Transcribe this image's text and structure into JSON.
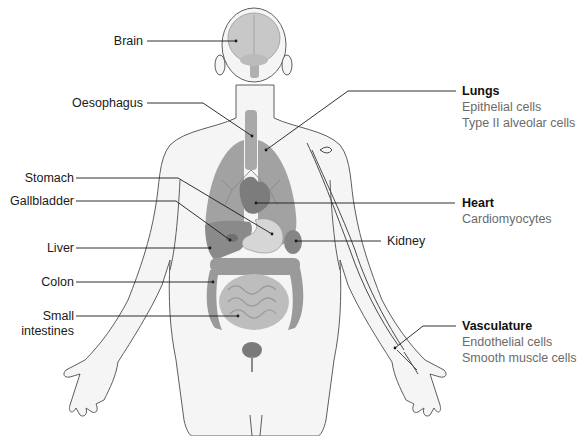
{
  "colors": {
    "background": "#ffffff",
    "body_fill": "#f4f4f4",
    "body_outline": "#5a5a5a",
    "organ_dark": "#8a8a8a",
    "organ_mid": "#a6a6a6",
    "organ_light": "#c9c9c9",
    "leader_line": "#1a1a1a",
    "label_text": "#1a1a1a",
    "subtitle_text": "#6b6b6b"
  },
  "left_labels": [
    {
      "id": "brain",
      "text": "Brain"
    },
    {
      "id": "oesophagus",
      "text": "Oesophagus"
    },
    {
      "id": "stomach",
      "text": "Stomach"
    },
    {
      "id": "gallbladder",
      "text": "Gallbladder"
    },
    {
      "id": "liver",
      "text": "Liver"
    },
    {
      "id": "colon",
      "text": "Colon"
    },
    {
      "id": "small_intestines",
      "text": "Small",
      "text2": "intestines"
    }
  ],
  "kidney_label": {
    "text": "Kidney"
  },
  "right_groups": [
    {
      "id": "lungs",
      "title": "Lungs",
      "cells": [
        "Epithelial cells",
        "Type II alveolar cells"
      ]
    },
    {
      "id": "heart",
      "title": "Heart",
      "cells": [
        "Cardiomyocytes"
      ]
    },
    {
      "id": "vasculature",
      "title": "Vasculature",
      "cells": [
        "Endothelial cells",
        "Smooth muscle cells"
      ]
    }
  ]
}
